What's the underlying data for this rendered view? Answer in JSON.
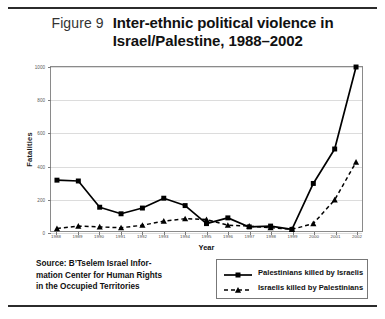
{
  "figure": {
    "label": "Figure 9",
    "title_line1": "Inter-ethnic political violence in",
    "title_line2": "Israel/Palestine, 1988–2002"
  },
  "source": {
    "line1": "Source: B’Tselem Israel Infor-",
    "line2": "mation Center for Human Rights",
    "line3": "in the Occupied Territories"
  },
  "legend": {
    "position": "bottom-right",
    "items": [
      {
        "label": "Palestinians killed by Israelis",
        "marker": "square",
        "line": "solid",
        "color": "#000000"
      },
      {
        "label": "Israelis killed by Palestinians",
        "marker": "triangle",
        "line": "dashed",
        "color": "#000000"
      }
    ]
  },
  "chart_data": {
    "type": "line",
    "title": "Inter-ethnic political violence in Israel/Palestine, 1988–2002",
    "xlabel": "Year",
    "ylabel": "Fatalities",
    "grid": true,
    "xlim": [
      1988,
      2002
    ],
    "ylim": [
      0,
      1000
    ],
    "yticks": [
      0,
      200,
      400,
      600,
      800,
      1000
    ],
    "ytick_labels": [
      "0",
      "200",
      "400",
      "600",
      "800",
      "1000"
    ],
    "categories": [
      1988,
      1989,
      1990,
      1991,
      1992,
      1993,
      1994,
      1995,
      1996,
      1997,
      1998,
      1999,
      2000,
      2001,
      2002
    ],
    "xtick_labels": [
      "1988",
      "1989",
      "1990",
      "1991",
      "1992",
      "1993",
      "1994",
      "1995",
      "1996",
      "1997",
      "1998",
      "1999",
      "2000",
      "2001",
      "2002"
    ],
    "series": [
      {
        "name": "Palestinians killed by Israelis",
        "marker": "square",
        "line": "solid",
        "color": "#000000",
        "values": [
          310,
          305,
          145,
          105,
          140,
          200,
          155,
          45,
          80,
          25,
          30,
          10,
          290,
          500,
          1000
        ]
      },
      {
        "name": "Israelis killed by Palestinians",
        "marker": "triangle",
        "line": "dashed",
        "color": "#000000",
        "values": [
          15,
          30,
          25,
          20,
          35,
          60,
          75,
          70,
          35,
          30,
          20,
          10,
          45,
          190,
          420
        ]
      }
    ]
  }
}
